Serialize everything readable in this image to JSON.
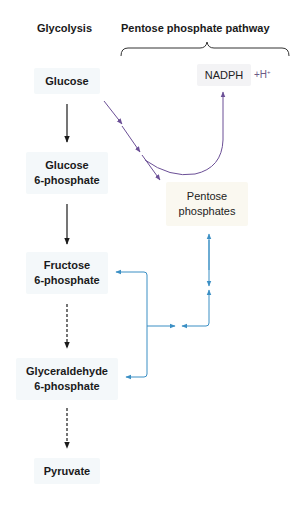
{
  "headers": {
    "glycolysis": "Glycolysis",
    "pentose_pathway": "Pentose phosphate pathway"
  },
  "glycolysis_nodes": [
    {
      "line1": "Glucose",
      "line2": ""
    },
    {
      "line1": "Glucose",
      "line2": "6-phosphate"
    },
    {
      "line1": "Fructose",
      "line2": "6-phosphate"
    },
    {
      "line1": "Glyceraldehyde",
      "line2": "6-phosphate"
    },
    {
      "line1": "Pyruvate",
      "line2": ""
    }
  ],
  "pentose_nodes": {
    "nadph": "NADPH",
    "hplus": "+H",
    "hplus_sup": "+",
    "pentose_line1": "Pentose",
    "pentose_line2": "phosphates"
  },
  "colors": {
    "glycolysis_arrow": "#1a1a1a",
    "oxidative_arrow": "#6b4f96",
    "nonoxidative_arrow": "#3b8fc4"
  }
}
